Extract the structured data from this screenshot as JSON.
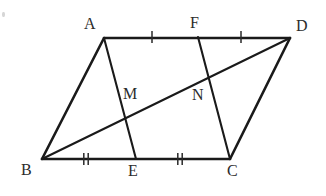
{
  "figure": {
    "background_color": "#ffffff",
    "stroke_color": "#1a1a1a",
    "label_color": "#2b2b2b",
    "width": 326,
    "height": 196,
    "points": {
      "A": {
        "label": "A",
        "x": 104,
        "y": 38,
        "label_x": 84,
        "label_y": 16
      },
      "B": {
        "label": "B",
        "x": 42,
        "y": 159,
        "label_x": 21,
        "label_y": 162
      },
      "C": {
        "label": "C",
        "x": 230,
        "y": 159,
        "label_x": 227,
        "label_y": 163
      },
      "D": {
        "label": "D",
        "x": 290,
        "y": 38,
        "label_x": 296,
        "label_y": 18
      },
      "E": {
        "label": "E",
        "x": 136,
        "y": 159,
        "label_x": 128,
        "label_y": 163
      },
      "F": {
        "label": "F",
        "x": 198,
        "y": 37,
        "label_x": 190,
        "label_y": 15
      },
      "M": {
        "label": "M",
        "x": 125,
        "y": 115,
        "label_x": 123,
        "label_y": 86
      },
      "N": {
        "label": "N",
        "x": 208,
        "y": 78,
        "label_x": 192,
        "label_y": 87
      }
    },
    "segments": [
      {
        "name": "segment-AD",
        "from": "A",
        "to": "D",
        "weight": "thick"
      },
      {
        "name": "segment-BC",
        "from": "B",
        "to": "C",
        "weight": "thick"
      },
      {
        "name": "segment-AB",
        "from": "A",
        "to": "B",
        "weight": "thick"
      },
      {
        "name": "segment-DC",
        "from": "D",
        "to": "C",
        "weight": "thick"
      },
      {
        "name": "segment-AE",
        "from": "A",
        "to": "E",
        "weight": "med"
      },
      {
        "name": "segment-FC",
        "from": "F",
        "to": "C",
        "weight": "med"
      },
      {
        "name": "segment-BD",
        "from": "B",
        "to": "D",
        "weight": "med"
      }
    ],
    "tick_marks": [
      {
        "name": "tick-AF",
        "on": "A-F",
        "x": 152,
        "y": 37,
        "count": 1
      },
      {
        "name": "tick-FD",
        "on": "F-D",
        "x": 241,
        "y": 37,
        "count": 1
      },
      {
        "name": "tick-BE",
        "on": "B-E",
        "x": 86,
        "y": 159,
        "count": 2
      },
      {
        "name": "tick-EC",
        "on": "E-C",
        "x": 180,
        "y": 159,
        "count": 2
      }
    ],
    "speck": {
      "x": 2,
      "y": 12
    }
  }
}
